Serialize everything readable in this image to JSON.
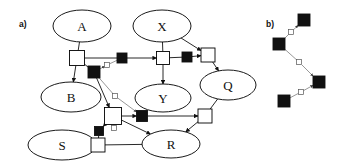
{
  "figure": {
    "type": "graph-diagram",
    "background_color": "#ffffff",
    "stroke_color": "#111111",
    "node_fill": "#ffffff",
    "filled_square_color": "#111111",
    "open_square_color": "#ffffff",
    "panels": [
      {
        "id": "panel-a",
        "label": "a)",
        "label_x": 19,
        "label_y": 24
      },
      {
        "id": "panel-b",
        "label": "b)",
        "label_x": 266,
        "label_y": 24
      }
    ]
  },
  "panel_a": {
    "nodes": [
      {
        "id": "A",
        "label": "A",
        "cx": 82,
        "cy": 26,
        "rx": 29,
        "ry": 16
      },
      {
        "id": "X",
        "label": "X",
        "cx": 162,
        "cy": 26,
        "rx": 29,
        "ry": 16
      },
      {
        "id": "B",
        "label": "B",
        "cx": 71,
        "cy": 97,
        "rx": 30,
        "ry": 15
      },
      {
        "id": "Y",
        "label": "Y",
        "cx": 163,
        "cy": 98,
        "rx": 28,
        "ry": 14
      },
      {
        "id": "Q",
        "label": "Q",
        "cx": 228,
        "cy": 85,
        "rx": 28,
        "ry": 15
      },
      {
        "id": "S",
        "label": "S",
        "cx": 62,
        "cy": 145,
        "rx": 34,
        "ry": 15
      },
      {
        "id": "R",
        "label": "R",
        "cx": 171,
        "cy": 144,
        "rx": 29,
        "ry": 14
      }
    ],
    "squares": [
      {
        "id": "sq-a-open",
        "kind": "open",
        "cx": 77,
        "cy": 58,
        "size": 15
      },
      {
        "id": "sq-ab-filled",
        "kind": "filled",
        "cx": 94,
        "cy": 72,
        "size": 12
      },
      {
        "id": "sq-mid-filled",
        "kind": "filled",
        "cx": 122,
        "cy": 58,
        "size": 10
      },
      {
        "id": "sq-x-open",
        "kind": "open",
        "cx": 163,
        "cy": 58,
        "size": 13
      },
      {
        "id": "sq-xq-filled",
        "kind": "filled",
        "cx": 187,
        "cy": 57,
        "size": 10
      },
      {
        "id": "sq-q-open",
        "kind": "open",
        "cx": 208,
        "cy": 55,
        "size": 14
      },
      {
        "id": "sq-hub-open",
        "kind": "open",
        "cx": 113,
        "cy": 116,
        "size": 17
      },
      {
        "id": "sq-hub-filled",
        "kind": "filled",
        "cx": 142,
        "cy": 116,
        "size": 11
      },
      {
        "id": "sq-right-open",
        "kind": "open",
        "cx": 205,
        "cy": 116,
        "size": 14
      },
      {
        "id": "sq-low-filled",
        "kind": "filled",
        "cx": 99,
        "cy": 131,
        "size": 9
      },
      {
        "id": "sq-s-open",
        "kind": "open",
        "cx": 98,
        "cy": 145,
        "size": 14
      },
      {
        "id": "sq-tiny-1",
        "kind": "open-small",
        "cx": 107,
        "cy": 65,
        "size": 5
      },
      {
        "id": "sq-tiny-2",
        "kind": "open-small",
        "cx": 115,
        "cy": 96,
        "size": 5
      },
      {
        "id": "sq-tiny-3",
        "kind": "open-small",
        "cx": 114,
        "cy": 128,
        "size": 5
      }
    ],
    "edges": [
      {
        "from": "A",
        "to": "sq-a-open",
        "arrow": false,
        "style": "solid"
      },
      {
        "from": "sq-a-open",
        "to": "B",
        "arrow": true,
        "style": "solid"
      },
      {
        "from": "sq-a-open",
        "to": "sq-ab-filled",
        "arrow": false,
        "style": "solid"
      },
      {
        "from": "sq-a-open",
        "to": "sq-mid-filled",
        "arrow": false,
        "style": "solid"
      },
      {
        "from": "sq-mid-filled",
        "to": "sq-x-open",
        "arrow": true,
        "style": "solid"
      },
      {
        "from": "sq-ab-filled",
        "to": "sq-tiny-1",
        "arrow": true,
        "style": "thin"
      },
      {
        "from": "sq-tiny-1",
        "to": "sq-mid-filled",
        "arrow": false,
        "style": "thin"
      },
      {
        "from": "X",
        "to": "sq-x-open",
        "arrow": false,
        "style": "solid"
      },
      {
        "from": "X",
        "to": "sq-q-open",
        "arrow": true,
        "style": "solid"
      },
      {
        "from": "sq-x-open",
        "to": "Y",
        "arrow": true,
        "style": "solid"
      },
      {
        "from": "sq-x-open",
        "to": "sq-xq-filled",
        "arrow": false,
        "style": "solid"
      },
      {
        "from": "sq-xq-filled",
        "to": "sq-q-open",
        "arrow": true,
        "style": "solid"
      },
      {
        "from": "sq-q-open",
        "to": "Q",
        "arrow": true,
        "style": "solid"
      },
      {
        "from": "Q",
        "to": "sq-right-open",
        "arrow": false,
        "style": "solid"
      },
      {
        "from": "sq-ab-filled",
        "to": "sq-hub-open",
        "arrow": true,
        "style": "solid"
      },
      {
        "from": "sq-ab-filled",
        "to": "sq-tiny-2",
        "arrow": false,
        "style": "thin"
      },
      {
        "from": "sq-tiny-2",
        "to": "sq-hub-filled",
        "arrow": true,
        "style": "thin"
      },
      {
        "from": "sq-hub-open",
        "to": "sq-hub-filled",
        "arrow": true,
        "style": "solid"
      },
      {
        "from": "sq-hub-filled",
        "to": "sq-right-open",
        "arrow": true,
        "style": "solid"
      },
      {
        "from": "sq-hub-open",
        "to": "R",
        "arrow": true,
        "style": "solid"
      },
      {
        "from": "sq-right-open",
        "to": "R",
        "arrow": true,
        "style": "solid"
      },
      {
        "from": "sq-hub-open",
        "to": "sq-low-filled",
        "arrow": true,
        "style": "solid"
      },
      {
        "from": "sq-low-filled",
        "to": "sq-s-open",
        "arrow": false,
        "style": "solid"
      },
      {
        "from": "sq-s-open",
        "to": "S",
        "arrow": true,
        "style": "solid"
      },
      {
        "from": "R",
        "to": "sq-s-open",
        "arrow": false,
        "style": "solid"
      },
      {
        "from": "sq-tiny-3",
        "to": "sq-hub-open",
        "arrow": false,
        "style": "thin"
      }
    ]
  },
  "panel_b": {
    "squares": [
      {
        "id": "b-top",
        "kind": "filled",
        "cx": 304,
        "cy": 20,
        "size": 12
      },
      {
        "id": "b-left",
        "kind": "filled",
        "cx": 279,
        "cy": 44,
        "size": 12
      },
      {
        "id": "b-right",
        "kind": "filled",
        "cx": 319,
        "cy": 82,
        "size": 12
      },
      {
        "id": "b-bottom",
        "kind": "filled",
        "cx": 284,
        "cy": 101,
        "size": 12
      },
      {
        "id": "b-tiny-1",
        "kind": "open-small",
        "cx": 291,
        "cy": 32,
        "size": 5
      },
      {
        "id": "b-tiny-2",
        "kind": "open-small",
        "cx": 299,
        "cy": 62,
        "size": 5
      },
      {
        "id": "b-tiny-3",
        "kind": "open-small",
        "cx": 301,
        "cy": 92,
        "size": 5
      }
    ],
    "edges": [
      {
        "from": "b-left",
        "to": "b-tiny-1",
        "arrow": false,
        "style": "thin"
      },
      {
        "from": "b-tiny-1",
        "to": "b-top",
        "arrow": true,
        "style": "thin"
      },
      {
        "from": "b-left",
        "to": "b-tiny-2",
        "arrow": false,
        "style": "thin"
      },
      {
        "from": "b-tiny-2",
        "to": "b-right",
        "arrow": true,
        "style": "thin"
      },
      {
        "from": "b-bottom",
        "to": "b-tiny-3",
        "arrow": false,
        "style": "thin"
      },
      {
        "from": "b-tiny-3",
        "to": "b-right",
        "arrow": true,
        "style": "thin"
      }
    ]
  }
}
